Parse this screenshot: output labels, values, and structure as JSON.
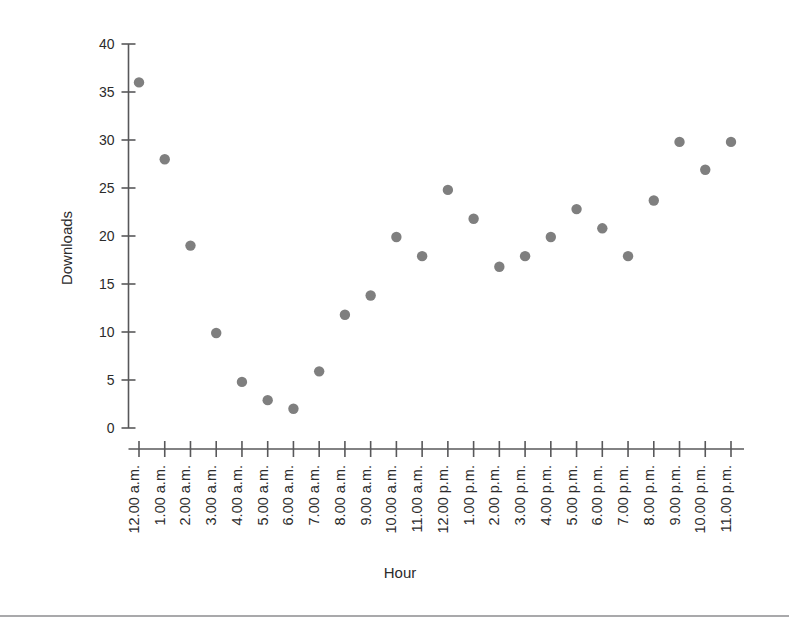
{
  "chart_data": {
    "type": "scatter",
    "title": "",
    "xlabel": "Hour",
    "ylabel": "Downloads",
    "xlim": [
      0,
      23
    ],
    "ylim": [
      0,
      40
    ],
    "ytick_values": [
      0,
      5,
      10,
      15,
      20,
      25,
      30,
      35,
      40
    ],
    "ytick_labels": [
      "0",
      "5",
      "10",
      "15",
      "20",
      "25",
      "30",
      "35",
      "40"
    ],
    "grid": false,
    "legend": "none",
    "marker": "filled-circle",
    "marker_color": "#7f7f7f",
    "axis_color": "#58585a",
    "categories": [
      "12.00 a.m.",
      "1.00 a.m.",
      "2.00 a.m.",
      "3.00 a.m.",
      "4.00 a.m.",
      "5.00 a.m.",
      "6.00 a.m.",
      "7.00 a.m.",
      "8.00 a.m.",
      "9.00 a.m.",
      "10.00 a.m.",
      "11.00 a.m.",
      "12.00 p.m.",
      "1.00 p.m.",
      "2.00 p.m.",
      "3.00 p.m.",
      "4.00 p.m.",
      "5.00 p.m.",
      "6.00 p.m.",
      "7.00 p.m.",
      "8.00 p.m.",
      "9.00 p.m.",
      "10.00 p.m.",
      "11.00 p.m."
    ],
    "values": [
      36.0,
      28.0,
      19.0,
      9.9,
      4.8,
      2.9,
      2.0,
      5.9,
      11.8,
      13.8,
      19.9,
      17.9,
      24.8,
      21.8,
      16.8,
      17.9,
      19.9,
      22.8,
      20.8,
      17.9,
      23.7,
      29.8,
      26.9,
      29.8
    ]
  }
}
